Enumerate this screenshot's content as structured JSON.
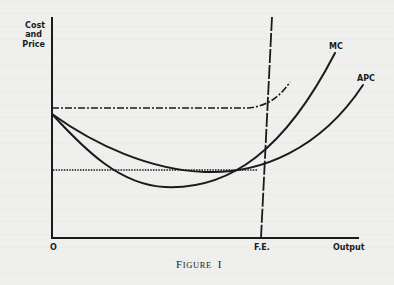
{
  "figure": {
    "caption_initial": "F",
    "caption_rest": "IGURE",
    "caption_number": "I",
    "y_axis_label_lines": [
      "Cost",
      "and",
      "Price"
    ],
    "x_axis_label": "Output",
    "origin_label": "O",
    "fe_label": "F.E.",
    "curves": [
      {
        "id": "mc",
        "label": "MC",
        "style": "solid",
        "shape": "U-shaped, lower minimum, steeper rise"
      },
      {
        "id": "apc",
        "label": "APC",
        "style": "solid",
        "shape": "U-shaped, shallower, minimum near F.E."
      },
      {
        "id": "price-line",
        "label": "",
        "style": "dash-dot",
        "shape": "horizontal then curving upward past F.E."
      },
      {
        "id": "min-apc-line",
        "label": "",
        "style": "dotted",
        "shape": "horizontal at APC minimum level"
      },
      {
        "id": "fe-line",
        "label": "F.E.",
        "style": "dashed",
        "shape": "near-vertical at full-employment output"
      }
    ],
    "colors": {
      "ink": "#1b1b1b",
      "paper": "#efefed"
    }
  }
}
